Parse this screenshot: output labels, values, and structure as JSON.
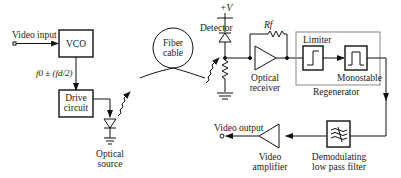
{
  "diagram": {
    "labels": {
      "video_input": "Video input",
      "vco": "VCO",
      "freq": "f0 ± (fd/2)",
      "drive_circuit_1": "Drive",
      "drive_circuit_2": "circuit",
      "optical_source_1": "Optical",
      "optical_source_2": "source",
      "fiber_cable_1": "Fiber",
      "fiber_cable_2": "cable",
      "supply": "+V",
      "detector": "Detector",
      "feedback_resistor": "Rf",
      "optical_receiver_1": "Optical",
      "optical_receiver_2": "receiver",
      "limiter": "Limiter",
      "monostable": "Monostable",
      "regenerator": "Regenerator",
      "video_output": "Video output",
      "video_amplifier_1": "Video",
      "video_amplifier_2": "amplifier",
      "lpf_1": "Demodulating",
      "lpf_2": "low pass filter"
    }
  }
}
